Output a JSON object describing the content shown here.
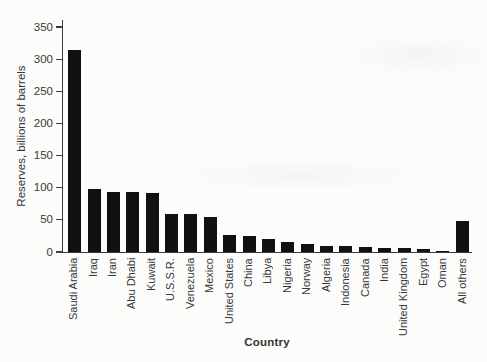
{
  "figure": {
    "background_color": "#fcfcfa",
    "bar_color": "#111111",
    "axis_color": "#3c3c3c",
    "text_color": "#383838"
  },
  "chart_data": {
    "type": "bar",
    "title": "",
    "xlabel": "Country",
    "ylabel": "Reserves, billions of barrels",
    "categories": [
      "Saudi Arabia",
      "Iraq",
      "Iran",
      "Abu Dhabi",
      "Kuwait",
      "U.S.S.R.",
      "Venezuela",
      "Mexico",
      "United States",
      "China",
      "Libya",
      "Nigeria",
      "Norway",
      "Algeria",
      "Indonesia",
      "Canada",
      "India",
      "United Kingdom",
      "Egypt",
      "Oman",
      "All others"
    ],
    "values": [
      315,
      98,
      94,
      93,
      92,
      59,
      59,
      54,
      26,
      25,
      21,
      15,
      12,
      10,
      9,
      8,
      7,
      6,
      4,
      2,
      49
    ],
    "ylim": [
      0,
      350
    ],
    "yticks": [
      0,
      50,
      100,
      150,
      200,
      250,
      300,
      350
    ],
    "grid": false,
    "legend_position": "none"
  }
}
